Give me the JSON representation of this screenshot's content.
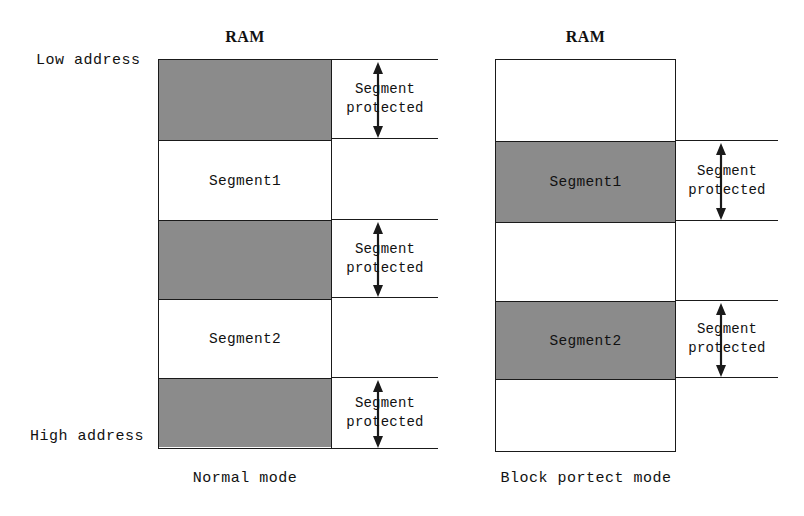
{
  "figure": {
    "left_panel": {
      "mode_label": "Normal mode",
      "ram_title": "RAM",
      "low_address_label": "Low address",
      "high_address_label": "High address",
      "bands": [
        {
          "kind": "protected",
          "fill": "gray",
          "label": "",
          "annotation": "Segment\nprotected"
        },
        {
          "kind": "segment",
          "fill": "white",
          "label": "Segment1",
          "annotation": ""
        },
        {
          "kind": "protected",
          "fill": "gray",
          "label": "",
          "annotation": "Segment\nprotected"
        },
        {
          "kind": "segment",
          "fill": "white",
          "label": "Segment2",
          "annotation": ""
        },
        {
          "kind": "protected",
          "fill": "gray",
          "label": "",
          "annotation": "Segment\nprotected"
        }
      ]
    },
    "right_panel": {
      "mode_label": "Block portect mode",
      "ram_title": "RAM",
      "bands": [
        {
          "kind": "free",
          "fill": "white",
          "label": "",
          "annotation": ""
        },
        {
          "kind": "segment",
          "fill": "gray",
          "label": "Segment1",
          "annotation": "Segment\nprotected"
        },
        {
          "kind": "free",
          "fill": "white",
          "label": "",
          "annotation": ""
        },
        {
          "kind": "segment",
          "fill": "gray",
          "label": "Segment2",
          "annotation": "Segment\nprotected"
        },
        {
          "kind": "free",
          "fill": "white",
          "label": "",
          "annotation": ""
        }
      ]
    },
    "annotation_line1": "Segment",
    "annotation_line2": "protected",
    "colors": {
      "shaded_block": "#8b8b8b",
      "outline": "#1a1a1a",
      "background": "#ffffff"
    }
  }
}
